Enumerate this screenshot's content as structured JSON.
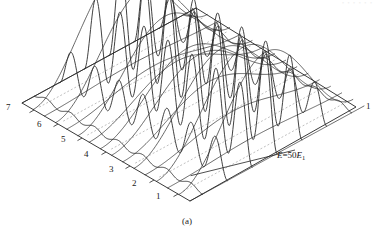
{
  "figure": {
    "caption": "(a)",
    "header_fragment": "• • • • • •",
    "energy_annotation": {
      "symbol": "E",
      "operator": "=",
      "value": "50",
      "unit_symbol": "E",
      "unit_subscript": "1",
      "full_text": "E=50E1"
    },
    "axis_labels_left": [
      "7",
      "6",
      "5",
      "4",
      "3",
      "2",
      "1"
    ],
    "axis_label_right": "1",
    "colors": {
      "mesh_line": "#2b2b2b",
      "base_outline": "#222222",
      "dashed_guide": "#b0b0b0",
      "background": "#ffffff",
      "text": "#1a1a1a"
    }
  },
  "chart_data": {
    "type": "line",
    "title": "",
    "subtitle": "",
    "xlabel": "",
    "ylabel": "",
    "projection": "parallel-oblique-3d",
    "grid": false,
    "legend": null,
    "energy_level": 50,
    "energy_units": "E1",
    "base_plane": {
      "corner_left": {
        "x": 22,
        "y": 103
      },
      "corner_top": {
        "x": 196,
        "y": 8
      },
      "corner_right": {
        "x": 356,
        "y": 107
      },
      "corner_bottom": {
        "x": 190,
        "y": 201
      }
    },
    "left_edge_ticks": {
      "count": 7,
      "labels": [
        "7",
        "6",
        "5",
        "4",
        "3",
        "2",
        "1"
      ],
      "positions": [
        {
          "label": "7",
          "x": 8,
          "y": 108
        },
        {
          "label": "6",
          "x": 39,
          "y": 125
        },
        {
          "label": "5",
          "x": 63,
          "y": 140
        },
        {
          "label": "4",
          "x": 86,
          "y": 155
        },
        {
          "label": "3",
          "x": 111,
          "y": 170
        },
        {
          "label": "2",
          "x": 134,
          "y": 184
        },
        {
          "label": "1",
          "x": 158,
          "y": 197
        }
      ]
    },
    "right_edge_tick": {
      "label": "1",
      "x": 366,
      "y": 103
    },
    "mesh": {
      "rows": 7,
      "row_curves_per_row": 1,
      "dashed_guides": 7,
      "humps_per_curve": 7,
      "line_width": 0.9,
      "dashed_pattern": "2 2"
    },
    "surface_function": "|psi(x,y)|^2 ~ sin^2(n*pi*x/L) * sin^2(m*pi*y/L)",
    "axis_ranges": {
      "x": [
        1,
        7
      ],
      "y": [
        1,
        7
      ]
    },
    "series": [
      {
        "name": "row-1",
        "index": 1,
        "amplitude_scale": 1.0
      },
      {
        "name": "row-2",
        "index": 2,
        "amplitude_scale": 1.0
      },
      {
        "name": "row-3",
        "index": 3,
        "amplitude_scale": 1.0
      },
      {
        "name": "row-4",
        "index": 4,
        "amplitude_scale": 1.0
      },
      {
        "name": "row-5",
        "index": 5,
        "amplitude_scale": 1.0
      },
      {
        "name": "row-6",
        "index": 6,
        "amplitude_scale": 1.0
      },
      {
        "name": "row-7",
        "index": 7,
        "amplitude_scale": 1.0
      }
    ]
  }
}
